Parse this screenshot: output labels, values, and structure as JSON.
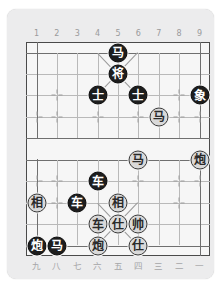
{
  "board": {
    "title": "Xiangqi Board",
    "files_top": [
      "1",
      "2",
      "3",
      "4",
      "5",
      "6",
      "7",
      "8",
      "9"
    ],
    "files_bottom": [
      "九",
      "八",
      "七",
      "六",
      "五",
      "四",
      "三",
      "二",
      "一"
    ],
    "colors": {
      "panel_bg": "#ececed",
      "board_bg": "#f6f6f6",
      "grid_line": "#b9b9b9",
      "frame_line": "#4a4a4a",
      "black_piece_bg": "#1d1d1d",
      "black_piece_text": "#ffffff",
      "red_piece_bg": "#d9d9d9",
      "red_piece_text": "#2a2a2a",
      "label_text": "#9a9a9c"
    },
    "pieces": [
      {
        "name": "black-horse",
        "label": "马",
        "side": "black",
        "col": 5,
        "row": 0
      },
      {
        "name": "black-general",
        "label": "将",
        "side": "black",
        "col": 5,
        "row": 1
      },
      {
        "name": "black-advisor",
        "label": "士",
        "side": "black",
        "col": 4,
        "row": 2
      },
      {
        "name": "black-advisor",
        "label": "士",
        "side": "black",
        "col": 6,
        "row": 2
      },
      {
        "name": "black-elephant",
        "label": "象",
        "side": "black",
        "col": 9,
        "row": 2
      },
      {
        "name": "red-horse",
        "label": "马",
        "side": "red",
        "col": 7,
        "row": 3
      },
      {
        "name": "red-horse",
        "label": "马",
        "side": "red",
        "col": 6,
        "row": 5
      },
      {
        "name": "red-cannon",
        "label": "炮",
        "side": "red",
        "col": 9,
        "row": 5
      },
      {
        "name": "black-chariot",
        "label": "车",
        "side": "black",
        "col": 4,
        "row": 6
      },
      {
        "name": "red-elephant",
        "label": "相",
        "side": "red",
        "col": 1,
        "row": 7
      },
      {
        "name": "black-chariot",
        "label": "车",
        "side": "black",
        "col": 3,
        "row": 7
      },
      {
        "name": "red-elephant",
        "label": "相",
        "side": "red",
        "col": 5,
        "row": 7
      },
      {
        "name": "red-chariot",
        "label": "车",
        "side": "red",
        "col": 4,
        "row": 8
      },
      {
        "name": "red-advisor",
        "label": "仕",
        "side": "red",
        "col": 5,
        "row": 8
      },
      {
        "name": "red-general",
        "label": "帅",
        "side": "red",
        "col": 6,
        "row": 8
      },
      {
        "name": "black-cannon",
        "label": "炮",
        "side": "black",
        "col": 1,
        "row": 9
      },
      {
        "name": "black-horse",
        "label": "马",
        "side": "black",
        "col": 2,
        "row": 9
      },
      {
        "name": "red-cannon",
        "label": "炮",
        "side": "red",
        "col": 4,
        "row": 9
      },
      {
        "name": "red-advisor",
        "label": "仕",
        "side": "red",
        "col": 6,
        "row": 9
      }
    ],
    "stars": [
      {
        "col": 2,
        "row": 2
      },
      {
        "col": 8,
        "row": 2
      },
      {
        "col": 2,
        "row": 3
      },
      {
        "col": 4,
        "row": 3
      },
      {
        "col": 6,
        "row": 3
      },
      {
        "col": 8,
        "row": 3
      },
      {
        "col": 1,
        "row": 3
      },
      {
        "col": 9,
        "row": 3
      },
      {
        "col": 2,
        "row": 6
      },
      {
        "col": 4,
        "row": 6
      },
      {
        "col": 6,
        "row": 6
      },
      {
        "col": 8,
        "row": 6
      },
      {
        "col": 1,
        "row": 6
      },
      {
        "col": 9,
        "row": 6
      },
      {
        "col": 2,
        "row": 7
      },
      {
        "col": 8,
        "row": 7
      }
    ]
  }
}
